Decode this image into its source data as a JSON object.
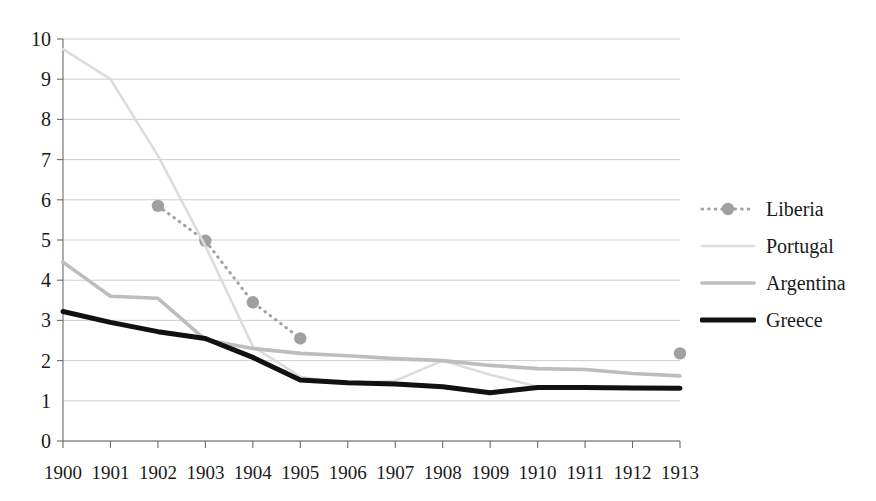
{
  "chart_data": {
    "type": "line",
    "title": "",
    "subtitle": "",
    "xlabel": "",
    "ylabel": "",
    "categories": [
      "1900",
      "1901",
      "1902",
      "1903",
      "1904",
      "1905",
      "1906",
      "1907",
      "1908",
      "1909",
      "1910",
      "1911",
      "1912",
      "1913"
    ],
    "x": [
      1900,
      1901,
      1902,
      1903,
      1904,
      1905,
      1906,
      1907,
      1908,
      1909,
      1910,
      1911,
      1912,
      1913
    ],
    "xlim": [
      1900,
      1913
    ],
    "ylim": [
      0,
      10
    ],
    "y_ticks": [
      0,
      1,
      2,
      3,
      4,
      5,
      6,
      7,
      8,
      9,
      10
    ],
    "x_ticks": [
      1900,
      1901,
      1902,
      1903,
      1904,
      1905,
      1906,
      1907,
      1908,
      1909,
      1910,
      1911,
      1912,
      1913
    ],
    "grid": "horizontal",
    "legend_position": "right",
    "series": [
      {
        "name": "Liberia",
        "style": "dotted-with-markers",
        "color": "#a0a0a0",
        "marker": "circle",
        "x": [
          1902,
          1903,
          1904,
          1905,
          1913
        ],
        "values": [
          5.85,
          4.98,
          3.45,
          2.55,
          2.18
        ],
        "segments": [
          [
            1902,
            1903,
            1904,
            1905
          ]
        ]
      },
      {
        "name": "Portugal",
        "style": "solid-thin",
        "color": "#dcdcdc",
        "marker": "none",
        "x": [
          1900,
          1901,
          1902,
          1903,
          1904,
          1905,
          1906,
          1907,
          1908,
          1909,
          1910
        ],
        "values": [
          9.75,
          9.0,
          7.1,
          4.85,
          2.35,
          1.6,
          1.42,
          1.5,
          2.0,
          1.65,
          1.35
        ]
      },
      {
        "name": "Argentina",
        "style": "solid-medium",
        "color": "#bdbdbd",
        "marker": "none",
        "x": [
          1900,
          1901,
          1902,
          1903,
          1904,
          1905,
          1906,
          1907,
          1908,
          1909,
          1910,
          1911,
          1912,
          1913
        ],
        "values": [
          4.45,
          3.6,
          3.55,
          2.52,
          2.3,
          2.18,
          2.12,
          2.05,
          2.0,
          1.88,
          1.8,
          1.78,
          1.68,
          1.62
        ]
      },
      {
        "name": "Greece",
        "style": "solid-thick",
        "color": "#111111",
        "marker": "none",
        "x": [
          1900,
          1901,
          1902,
          1903,
          1904,
          1905,
          1906,
          1907,
          1908,
          1909,
          1910,
          1911,
          1912,
          1913
        ],
        "values": [
          3.22,
          2.95,
          2.72,
          2.55,
          2.08,
          1.52,
          1.45,
          1.42,
          1.35,
          1.2,
          1.33,
          1.33,
          1.32,
          1.31
        ]
      }
    ]
  },
  "axes": {
    "y_tick_labels": [
      "10",
      "9",
      "8",
      "7",
      "6",
      "5",
      "4",
      "3",
      "2",
      "1",
      "0"
    ],
    "x_tick_labels": [
      "1900",
      "1901",
      "1902",
      "1903",
      "1904",
      "1905",
      "1906",
      "1907",
      "1908",
      "1909",
      "1910",
      "1911",
      "1912",
      "1913"
    ]
  },
  "legend": {
    "entries": [
      {
        "label": "Liberia"
      },
      {
        "label": "Portugal"
      },
      {
        "label": "Argentina"
      },
      {
        "label": "Greece"
      }
    ]
  },
  "colors": {
    "axis": "#6b6b6b",
    "grid": "#c8c8c8",
    "text": "#1a1a1a",
    "liberia": "#a0a0a0",
    "portugal": "#dcdcdc",
    "argentina": "#bdbdbd",
    "greece": "#111111",
    "background": "#ffffff"
  },
  "geometry": {
    "plot_left": 63,
    "plot_right": 680,
    "plot_top": 39,
    "plot_bottom": 441
  }
}
